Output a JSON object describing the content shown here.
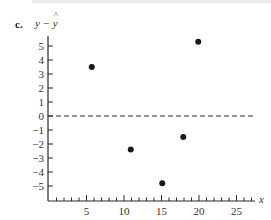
{
  "panel": {
    "label": "c.",
    "ylabel_prefix": "y − ",
    "ylabel_hat": "y",
    "xlabel": "x"
  },
  "colors": {
    "axis": "#2a2a2a",
    "point": "#1a1a1a",
    "text": "#333333",
    "top_bar": "#ececec"
  },
  "chart_data": {
    "type": "scatter",
    "title": "",
    "panel_label": "c.",
    "xlabel": "x",
    "ylabel": "y − ŷ",
    "xlim": [
      0,
      27
    ],
    "ylim": [
      -6,
      6
    ],
    "x_ticks": [
      5,
      10,
      15,
      20,
      25
    ],
    "x_minor_tick_step": 1,
    "y_ticks": [
      5,
      4,
      3,
      2,
      1,
      0,
      -1,
      -2,
      -3,
      -4,
      -5
    ],
    "y_tick_labels": [
      "5",
      "4",
      "3",
      "2",
      "1",
      "0",
      "−1",
      "−2",
      "−3",
      "−4",
      "−5"
    ],
    "grid": false,
    "reference_line": {
      "y": 0,
      "style": "dashed"
    },
    "series": [
      {
        "name": "residuals",
        "points": [
          {
            "x": 5.7,
            "y": 3.5
          },
          {
            "x": 10.9,
            "y": -2.4
          },
          {
            "x": 15.1,
            "y": -4.8
          },
          {
            "x": 17.9,
            "y": -1.5
          },
          {
            "x": 19.9,
            "y": 5.3
          }
        ]
      }
    ]
  }
}
